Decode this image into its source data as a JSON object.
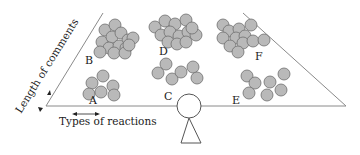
{
  "diagram": {
    "title": "",
    "colors": {
      "line": "#8a8a8a",
      "ink": "#222222",
      "circle_fill": "#b9b9b9",
      "circle_stroke": "#6e6e6e",
      "background": "#ffffff"
    },
    "axes": {
      "vertical_label": "Length of comments",
      "horizontal_label": "Types of reactions"
    },
    "fulcrum": {
      "cx": 189,
      "cy": 106,
      "r": 12
    },
    "clusters": [
      {
        "label": "A",
        "label_x": 89,
        "label_y": 104,
        "circles": [
          [
            92,
            83
          ],
          [
            103,
            76
          ],
          [
            89,
            94
          ],
          [
            101,
            92
          ],
          [
            113,
            86
          ],
          [
            114,
            95
          ]
        ]
      },
      {
        "label": "B",
        "label_x": 85,
        "label_y": 64,
        "circles": [
          [
            105,
            30
          ],
          [
            115,
            25
          ],
          [
            102,
            42
          ],
          [
            112,
            37
          ],
          [
            121,
            33
          ],
          [
            128,
            40
          ],
          [
            109,
            48
          ],
          [
            119,
            46
          ],
          [
            126,
            48
          ],
          [
            133,
            38
          ],
          [
            100,
            52
          ],
          [
            114,
            53
          ],
          [
            125,
            53
          ],
          [
            129,
            45
          ]
        ]
      },
      {
        "label": "C",
        "label_x": 164,
        "label_y": 100,
        "circles": [
          [
            166,
            64
          ],
          [
            158,
            73
          ],
          [
            172,
            79
          ],
          [
            181,
            72
          ],
          [
            193,
            67
          ],
          [
            197,
            78
          ]
        ]
      },
      {
        "label": "D",
        "label_x": 159,
        "label_y": 55,
        "circles": [
          [
            155,
            27
          ],
          [
            165,
            21
          ],
          [
            175,
            24
          ],
          [
            186,
            20
          ],
          [
            161,
            35
          ],
          [
            170,
            32
          ],
          [
            179,
            36
          ],
          [
            188,
            32
          ],
          [
            196,
            35
          ],
          [
            168,
            42
          ],
          [
            177,
            44
          ],
          [
            186,
            42
          ],
          [
            192,
            28
          ]
        ]
      },
      {
        "label": "E",
        "label_x": 232,
        "label_y": 104,
        "circles": [
          [
            247,
            76
          ],
          [
            255,
            83
          ],
          [
            270,
            82
          ],
          [
            284,
            74
          ],
          [
            249,
            93
          ],
          [
            267,
            95
          ],
          [
            281,
            90
          ]
        ]
      },
      {
        "label": "F",
        "label_x": 255,
        "label_y": 60,
        "circles": [
          [
            223,
            25
          ],
          [
            229,
            31
          ],
          [
            239,
            29
          ],
          [
            251,
            25
          ],
          [
            223,
            38
          ],
          [
            236,
            38
          ],
          [
            245,
            36
          ],
          [
            230,
            46
          ],
          [
            243,
            43
          ],
          [
            253,
            41
          ],
          [
            238,
            52
          ],
          [
            264,
            40
          ]
        ]
      }
    ]
  }
}
